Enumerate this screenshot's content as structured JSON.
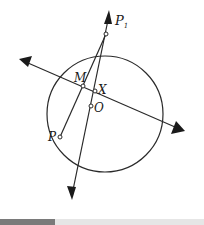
{
  "diagram": {
    "circle": {
      "cx": 105,
      "cy": 114,
      "r": 58
    },
    "labels": {
      "P1": "P",
      "P1_sub": "1",
      "M": "M",
      "X": "X",
      "O": "O",
      "P": "P"
    },
    "points": {
      "P1": {
        "x": 106,
        "y": 34
      },
      "M": {
        "x": 83,
        "y": 86
      },
      "X": {
        "x": 95,
        "y": 91
      },
      "O": {
        "x": 91,
        "y": 106
      },
      "P": {
        "x": 60,
        "y": 137
      }
    },
    "colors": {
      "stroke": "#2a2a2a",
      "fill": "#1a1a1a"
    }
  },
  "progress_bar": {
    "fraction": 0.27,
    "track_color": "#e6e6e6",
    "fill_color": "#7a7a7a"
  }
}
